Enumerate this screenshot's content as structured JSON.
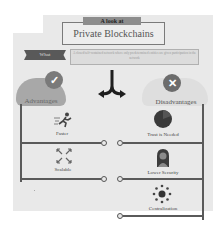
{
  "header": {
    "tab_label": "A look at",
    "title": "Private Blockchains"
  },
  "what": {
    "tag": "What",
    "description": "A closed/self-contained network where only predetermined entities are given participation in the network"
  },
  "divider_icon": "split-arrow-icon",
  "advantages": {
    "heading": "Advantages",
    "badge_icon": "check-icon",
    "items": [
      {
        "label": "Faster",
        "icon": "running-person-icon"
      },
      {
        "label": "Scalable",
        "icon": "expand-arrows-icon"
      }
    ]
  },
  "disadvantages": {
    "heading": "Disadvantages",
    "badge_icon": "x-icon",
    "items": [
      {
        "label": "Trust is Needed",
        "icon": "pie-chart-icon"
      },
      {
        "label": "Lower Security",
        "icon": "hacker-icon"
      },
      {
        "label": "Centralization",
        "icon": "hub-icon"
      }
    ]
  },
  "colors": {
    "panel_bg": "#e9e9e9",
    "dark_gray": "#595959",
    "line": "#5a5a5a",
    "adv_cloud": "#a8a8a8",
    "disadv_cloud": "#dedede"
  }
}
